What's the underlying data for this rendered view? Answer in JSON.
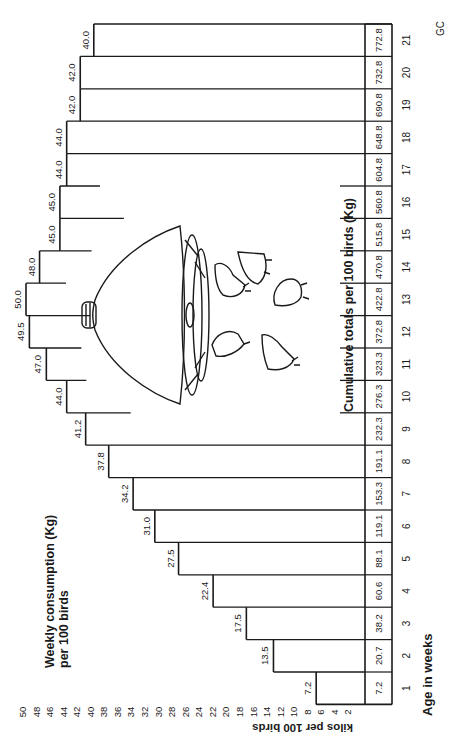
{
  "chart_data": {
    "type": "bar",
    "orientation": "rotated-90ccw",
    "title": "Weekly consumption (Kg) per 100 birds",
    "xlabel": "Age in weeks",
    "ylabel": "kilos per 100 birds",
    "ylim": [
      0,
      50
    ],
    "yticks": [
      2,
      4,
      6,
      8,
      10,
      12,
      14,
      16,
      18,
      20,
      22,
      24,
      26,
      28,
      30,
      32,
      34,
      36,
      38,
      40,
      42,
      44,
      46,
      48,
      50
    ],
    "categories": [
      "1",
      "2",
      "3",
      "4",
      "5",
      "6",
      "7",
      "8",
      "9",
      "10",
      "11",
      "12",
      "13",
      "14",
      "15",
      "16",
      "17",
      "18",
      "19",
      "20",
      "21"
    ],
    "series": [
      {
        "name": "Weekly consumption (Kg) per 100 birds",
        "values": [
          7.2,
          13.5,
          17.5,
          22.4,
          27.5,
          31.0,
          34.2,
          37.8,
          41.2,
          44.0,
          47.0,
          49.5,
          50.0,
          48.0,
          45.0,
          45.0,
          44.0,
          44.0,
          42.0,
          42.0,
          40.0
        ]
      },
      {
        "name": "Cumulative totals per 100 birds (Kg)",
        "values": [
          7.2,
          20.7,
          38.2,
          60.6,
          88.1,
          119.1,
          153.3,
          191.1,
          232.3,
          276.3,
          323.3,
          372.8,
          422.8,
          470.8,
          515.8,
          560.8,
          604.8,
          648.8,
          690.8,
          732.8,
          772.8
        ]
      }
    ],
    "value_labels": [
      "7.2",
      "13.5",
      "17.5",
      "22.4",
      "27.5",
      "31.0",
      "34.2",
      "37.8",
      "41.2",
      "44.0",
      "47.0",
      "49.5",
      "50.0",
      "48.0",
      "45.0",
      "45.0",
      "44.0",
      "44.0",
      "42.0",
      "42.0",
      "40.0"
    ],
    "cumulative_labels": [
      "7.2",
      "20.7",
      "38.2",
      "60.6",
      "88.1",
      "119.1",
      "153.3",
      "191.1",
      "232.3",
      "276.3",
      "323.3",
      "372.8",
      "422.8",
      "470.8",
      "515.8",
      "560.8",
      "604.8",
      "648.8",
      "690.8",
      "732.8",
      "772.8"
    ],
    "cumulative_title": "Cumulative totals per 100 birds (Kg)",
    "annotations": [
      "Brooder lamp with chicks illustration",
      "GC"
    ],
    "grid": false,
    "legend": "none"
  },
  "labels": {
    "title_line1": "Weekly consumption (Kg)",
    "title_line2": "per 100 birds",
    "y_axis": "kilos per 100 birds",
    "x_axis": "Age in weeks",
    "cumulative": "Cumulative totals per 100 birds (Kg)",
    "signature": "GC"
  },
  "colors": {
    "ink": "#1a1a1a",
    "background": "#ffffff"
  }
}
